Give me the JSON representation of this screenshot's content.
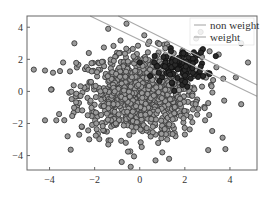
{
  "chart_data": {
    "type": "scatter",
    "title": "",
    "xlabel": "",
    "ylabel": "",
    "xlim": [
      -5.0,
      5.2
    ],
    "ylim": [
      -4.9,
      4.7
    ],
    "x_ticks": [
      -4,
      -2,
      0,
      2,
      4
    ],
    "x_tick_labels": [
      "−4",
      "−2",
      "0",
      "2",
      "4"
    ],
    "y_ticks": [
      4,
      2,
      0,
      -2,
      -4
    ],
    "y_tick_labels": [
      "4",
      "2",
      "0",
      "−2",
      "−4"
    ],
    "grid": false,
    "legend_position": "upper right",
    "series": [
      {
        "name": "majority class",
        "kind": "points",
        "marker": "circle",
        "face_color": "#9a9a9a",
        "edge_color": "#3a3a3a",
        "center": [
          0.0,
          -0.2
        ],
        "spread": [
          1.35,
          1.35
        ],
        "count": 900,
        "sample_points": [
          [
            -4.2,
            -1.8
          ],
          [
            -3.7,
            -1.8
          ],
          [
            -3.2,
            -2.8
          ],
          [
            -4.2,
            1.3
          ],
          [
            -3.4,
            1.8
          ],
          [
            -2.9,
            3.0
          ],
          [
            -0.8,
            -4.4
          ],
          [
            -0.4,
            -4.7
          ],
          [
            0.7,
            -4.3
          ],
          [
            1.3,
            -4.2
          ],
          [
            1.0,
            -3.8
          ],
          [
            3.8,
            -3.6
          ],
          [
            2.9,
            -1.8
          ],
          [
            4.5,
            3.0
          ],
          [
            4.8,
            1.8
          ],
          [
            3.4,
            1.5
          ],
          [
            3.7,
            0.8
          ],
          [
            -1.4,
            3.9
          ],
          [
            0.2,
            3.5
          ],
          [
            2.7,
            3.7
          ],
          [
            2.5,
            3.3
          ],
          [
            3.1,
            2.5
          ],
          [
            3.5,
            2.3
          ],
          [
            4.5,
            -0.8
          ]
        ]
      },
      {
        "name": "minority class",
        "kind": "points",
        "marker": "circle",
        "face_color": "#2a2a2a",
        "edge_color": "#111111",
        "center": [
          1.8,
          1.6
        ],
        "spread": [
          0.6,
          0.5
        ],
        "count": 110
      },
      {
        "name": "non weight",
        "kind": "line",
        "color": "#aaaaaa",
        "x": [
          -2.2,
          5.2
        ],
        "y": [
          4.7,
          -0.3
        ]
      },
      {
        "name": "weight",
        "kind": "line",
        "color": "#aaaaaa",
        "x": [
          -0.95,
          5.2
        ],
        "y": [
          4.7,
          0.4
        ]
      }
    ],
    "legend": [
      {
        "label": "non weight",
        "color": "#aaaaaa"
      },
      {
        "label": "weight",
        "color": "#aaaaaa"
      }
    ]
  }
}
